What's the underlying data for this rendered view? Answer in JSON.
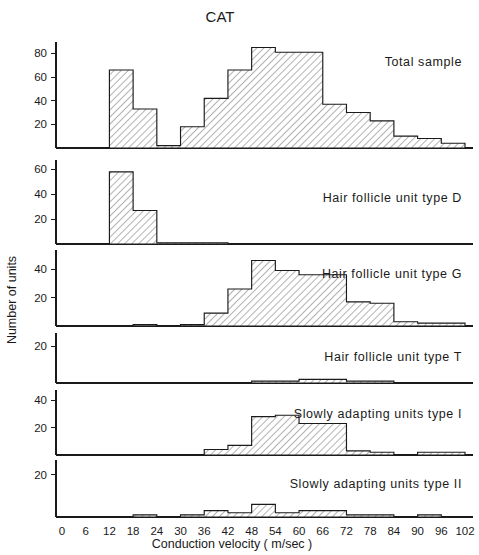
{
  "figure": {
    "title": "CAT",
    "xlabel": "Conduction  velocity  ( m/sec )",
    "ylabel": "Number  of  units"
  },
  "chart_data": {
    "type": "bar",
    "title": "CAT",
    "xlabel": "Conduction velocity (m/sec)",
    "ylabel": "Number of units",
    "xlim": [
      0,
      102
    ],
    "bin_width": 6,
    "bin_edges": [
      0,
      6,
      12,
      18,
      24,
      30,
      36,
      42,
      48,
      54,
      60,
      66,
      72,
      78,
      84,
      90,
      96,
      102
    ],
    "bin_labels": [
      "0-6",
      "6-12",
      "12-18",
      "18-24",
      "24-30",
      "30-36",
      "36-42",
      "42-48",
      "48-54",
      "54-60",
      "60-66",
      "66-72",
      "72-78",
      "78-84",
      "84-90",
      "90-96",
      "96-102"
    ],
    "xticks": [
      0,
      6,
      12,
      18,
      24,
      30,
      36,
      42,
      48,
      54,
      60,
      66,
      72,
      78,
      84,
      90,
      96,
      102
    ],
    "grid": false,
    "legend": "none",
    "panels": [
      {
        "label": "Total  sample",
        "name": "total-sample",
        "ylim": [
          0,
          88
        ],
        "yticks": [
          20,
          40,
          60,
          80
        ],
        "values": [
          0,
          0,
          66,
          33,
          2,
          18,
          42,
          66,
          85,
          81,
          81,
          37,
          30,
          23,
          10,
          8,
          4,
          2
        ]
      },
      {
        "label": "Hair  follicle  unit  type  D",
        "name": "hair-follicle-unit-type-d",
        "ylim": [
          0,
          66
        ],
        "yticks": [
          20,
          40,
          60
        ],
        "values": [
          0,
          0,
          58,
          27,
          1,
          1,
          1,
          0,
          0,
          0,
          0,
          0,
          0,
          0,
          0,
          0,
          0,
          0
        ]
      },
      {
        "label": "Hair  follicle  unit  type  G",
        "name": "hair-follicle-unit-type-g",
        "ylim": [
          0,
          52
        ],
        "yticks": [
          20,
          40
        ],
        "values": [
          0,
          0,
          0,
          1,
          0,
          1,
          9,
          26,
          46,
          39,
          36,
          36,
          17,
          16,
          3,
          2,
          2,
          0
        ]
      },
      {
        "label": "Hair  follicle  unit  type  T",
        "name": "hair-follicle-unit-type-t",
        "ylim": [
          0,
          26
        ],
        "yticks": [
          20
        ],
        "values": [
          0,
          0,
          0,
          0,
          0,
          0,
          0,
          0,
          1,
          1,
          2,
          2,
          1,
          1,
          0,
          0,
          0,
          0
        ]
      },
      {
        "label": "Slowly  adapting  units  type  I",
        "name": "slowly-adapting-units-type-i",
        "ylim": [
          0,
          46
        ],
        "yticks": [
          20,
          40
        ],
        "values": [
          0,
          0,
          0,
          0,
          0,
          0,
          4,
          7,
          28,
          29,
          23,
          23,
          3,
          2,
          0,
          2,
          2,
          0
        ]
      },
      {
        "label": "Slowly  adapting  units  type  II",
        "name": "slowly-adapting-units-type-ii",
        "ylim": [
          0,
          26
        ],
        "yticks": [
          20
        ],
        "values": [
          0,
          0,
          0,
          1,
          0,
          1,
          3,
          2,
          6,
          2,
          3,
          3,
          1,
          1,
          0,
          1,
          0,
          1
        ]
      }
    ]
  }
}
